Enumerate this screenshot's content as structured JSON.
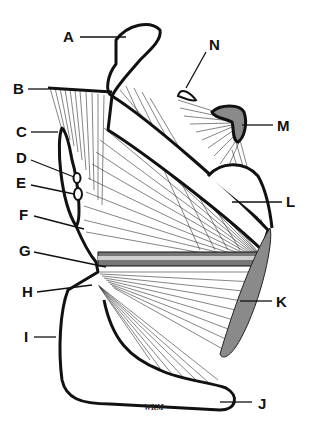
{
  "diagram": {
    "type": "anatomical line illustration",
    "labels": [
      {
        "id": "A",
        "text": "A",
        "x": 63,
        "y": 41
      },
      {
        "id": "B",
        "text": "B",
        "x": 14,
        "y": 93
      },
      {
        "id": "C",
        "text": "C",
        "x": 17,
        "y": 136
      },
      {
        "id": "D",
        "text": "D",
        "x": 17,
        "y": 162
      },
      {
        "id": "E",
        "text": "E",
        "x": 17,
        "y": 187
      },
      {
        "id": "F",
        "text": "F",
        "x": 20,
        "y": 219
      },
      {
        "id": "G",
        "text": "G",
        "x": 20,
        "y": 255
      },
      {
        "id": "H",
        "text": "H",
        "x": 23,
        "y": 296
      },
      {
        "id": "I",
        "text": "I",
        "x": 23,
        "y": 341
      },
      {
        "id": "J",
        "text": "J",
        "x": 260,
        "y": 408
      },
      {
        "id": "K",
        "text": "K",
        "x": 277,
        "y": 306
      },
      {
        "id": "L",
        "text": "L",
        "x": 287,
        "y": 206
      },
      {
        "id": "M",
        "text": "M",
        "x": 278,
        "y": 130
      },
      {
        "id": "N",
        "text": "N",
        "x": 212,
        "y": 49
      }
    ],
    "signature": "WKM",
    "colors": {
      "line": "#111111",
      "fiber": "#333333",
      "shaded_region": "#8a8a8a",
      "background": "#ffffff"
    }
  }
}
